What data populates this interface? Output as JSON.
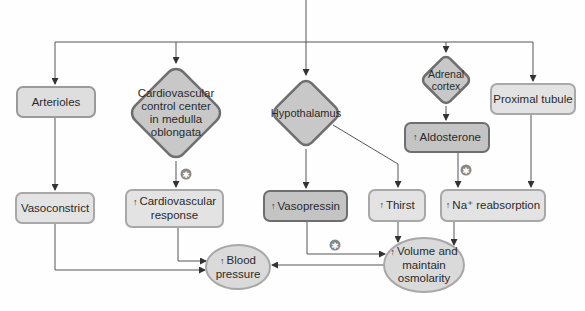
{
  "diagram": {
    "nodes": {
      "arterioles": {
        "label": "Arterioles"
      },
      "cv_center": {
        "label": "Cardiovascular control center in medulla oblongata"
      },
      "hypothalamus": {
        "label": "Hypothalamus"
      },
      "adrenal_cortex": {
        "label": "Adrenal cortex"
      },
      "proximal_tubule": {
        "label": "Proximal tubule"
      },
      "aldosterone": {
        "arrow": "↑",
        "label": "Aldosterone"
      },
      "vasoconstrict": {
        "label": "Vasoconstrict"
      },
      "cv_response": {
        "arrow": "↑",
        "label": "Cardiovascular response"
      },
      "vasopressin": {
        "arrow": "↑",
        "label": "Vasopressin"
      },
      "thirst": {
        "arrow": "↑",
        "label": "Thirst"
      },
      "na_reabsorption": {
        "arrow": "↑",
        "label": "Na⁺ reabsorption"
      },
      "blood_pressure": {
        "arrow": "↑",
        "label": "Blood pressure"
      },
      "volume": {
        "arrow": "↑",
        "label": "Volume and maintain osmolarity"
      }
    },
    "markers": {
      "icon": "star-badge-icon",
      "count": 3
    },
    "colors": {
      "box_fill": "#dedede",
      "box_border": "#9a9a9a",
      "dark_fill": "#c4c4c4",
      "dark_border": "#6e6e6e",
      "diamond_fill": "#c8c8c8",
      "line": "#444444"
    }
  }
}
